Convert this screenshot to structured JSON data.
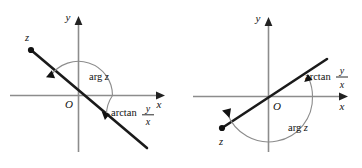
{
  "figure": {
    "width": 362,
    "height": 168,
    "background": "#ffffff",
    "ink": "#111111",
    "axis_color": "#8c8c8c"
  },
  "panels": [
    {
      "id": "left",
      "description": "Point z in the second quadrant; arg z is an obtuse angle measured counterclockwise from the positive x-axis, while arctan(y/x) is the acute angle below the positive x-axis.",
      "axis_labels": {
        "x": "x",
        "y": "y"
      },
      "origin_label": "O",
      "point_label": "z",
      "arg_label": {
        "text": "arg",
        "variable": "z"
      },
      "arctan_label": {
        "function": "arctan",
        "numerator": "y",
        "denominator": "x"
      },
      "point_quadrant": "second",
      "arg_degrees": 145,
      "arctan_degrees": -35
    },
    {
      "id": "right",
      "description": "Point z in the third quadrant; arg z is a reflex-looking angle swept counterclockwise past the negative x-axis, while arctan(y/x) is the acute angle above the positive x-axis.",
      "axis_labels": {
        "x": "x",
        "y": "y"
      },
      "origin_label": "O",
      "point_label": "z",
      "arg_label": {
        "text": "arg",
        "variable": "z"
      },
      "arctan_label": {
        "function": "arctan",
        "numerator": "y",
        "denominator": "x"
      },
      "point_quadrant": "third",
      "arg_degrees": 202,
      "arctan_degrees": 22
    }
  ]
}
